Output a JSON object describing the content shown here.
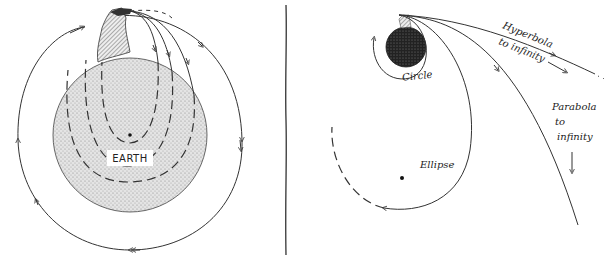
{
  "left_panel": {
    "earth_label": "EARTH",
    "description": "Cannon on mountain firing projectiles at increasing speeds; low-speed paths curve into Earth (dashed continuation inside Earth), highest speed closes into circular orbit around Earth"
  },
  "right_panel": {
    "labels": {
      "circle": "Circle",
      "ellipse": "Ellipse",
      "hyperbola_line1": "Hyperbola",
      "hyperbola_line2": "to infinity",
      "parabola_line1": "Parabola",
      "parabola_line2": "to",
      "parabola_line3": "infinity"
    },
    "description": "Orbits from launch point above planet: circle, ellipse, parabola to infinity, hyperbola to infinity"
  },
  "colors": {
    "ink": "#333333",
    "earth_fill": "#d9d9d9",
    "planet_fill": "#2a2a2a",
    "background": "#ffffff"
  }
}
